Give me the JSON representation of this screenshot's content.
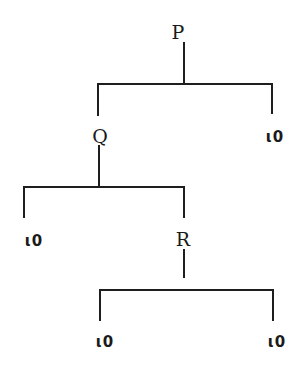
{
  "diagram": {
    "type": "tree",
    "nodes": {
      "P": {
        "label": "P"
      },
      "Q": {
        "label": "Q"
      },
      "R": {
        "label": "R"
      }
    },
    "leaves": [
      {
        "id": "leaf-p-right",
        "label": "ι0"
      },
      {
        "id": "leaf-q-left",
        "label": "ι0"
      },
      {
        "id": "leaf-r-left",
        "label": "ι0"
      },
      {
        "id": "leaf-r-right",
        "label": "ι0"
      }
    ],
    "edges": [
      [
        "P",
        "Q"
      ],
      [
        "P",
        "leaf-p-right"
      ],
      [
        "Q",
        "leaf-q-left"
      ],
      [
        "Q",
        "R"
      ],
      [
        "R",
        "leaf-r-left"
      ],
      [
        "R",
        "leaf-r-right"
      ]
    ],
    "line_color": "#1e1e1e",
    "text_color": "#1a1a1a"
  }
}
